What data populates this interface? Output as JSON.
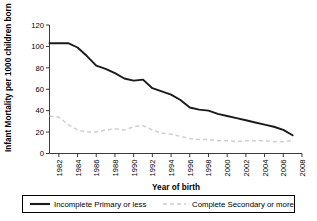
{
  "chart_data": {
    "type": "line",
    "title": "",
    "xlabel": "Year of birth",
    "ylabel": "Infant Mortality per 1000 children born",
    "xlim": [
      1981,
      2008
    ],
    "ylim": [
      0,
      120
    ],
    "yticks": [
      0,
      20,
      40,
      60,
      80,
      100,
      120
    ],
    "xticks": [
      1982,
      1984,
      1986,
      1988,
      1990,
      1992,
      1994,
      1996,
      1998,
      2000,
      2002,
      2004,
      2006,
      2008
    ],
    "grid": false,
    "legend_position": "bottom",
    "x": [
      1981,
      1982,
      1983,
      1984,
      1985,
      1986,
      1987,
      1988,
      1989,
      1990,
      1991,
      1992,
      1993,
      1994,
      1995,
      1996,
      1997,
      1998,
      1999,
      2000,
      2001,
      2002,
      2003,
      2004,
      2005,
      2006,
      2007
    ],
    "series": [
      {
        "name": "Incomplete Primary or less",
        "style": "solid",
        "color": "#1a1a1a",
        "values": [
          103,
          103,
          103,
          99,
          91,
          82,
          79,
          75,
          70,
          68,
          69,
          61,
          58,
          55,
          50,
          43,
          41,
          40,
          37,
          35,
          33,
          31,
          29,
          27,
          25,
          22,
          17
        ]
      },
      {
        "name": "Complete Secondary or more",
        "style": "dashed",
        "color": "#cfcfcf",
        "values": [
          35,
          34,
          27,
          22,
          20,
          20,
          22,
          23,
          22,
          25,
          26,
          22,
          19,
          18,
          16,
          14,
          13,
          13,
          12,
          12,
          11,
          12,
          12,
          12,
          11,
          11,
          12
        ]
      }
    ],
    "legend": [
      {
        "label": "Incomplete Primary or less",
        "style": "solid",
        "color": "#1a1a1a"
      },
      {
        "label": "Complete Secondary or more",
        "style": "dashed",
        "color": "#cfcfcf"
      }
    ],
    "ytick_labels": [
      "0",
      "20",
      "40",
      "60",
      "80",
      "100",
      "120"
    ],
    "xtick_labels": [
      "1982",
      "1984",
      "1986",
      "1988",
      "1990",
      "1992",
      "1994",
      "1996",
      "1998",
      "2000",
      "2002",
      "2004",
      "2006",
      "2008"
    ]
  }
}
